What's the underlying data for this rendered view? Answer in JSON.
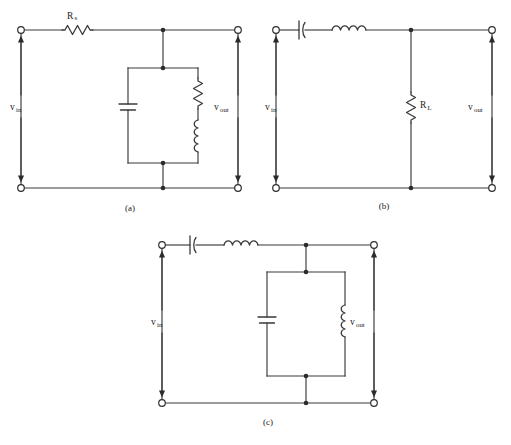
{
  "figure": {
    "background_color": "#ffffff",
    "ink_color": "#3a3a3a",
    "title": "",
    "type": "circuit-schematic-set"
  },
  "circuits": [
    {
      "id": "a",
      "caption": "(a)",
      "input_label_main": "v",
      "input_label_sub": "in",
      "output_label_main": "v",
      "output_label_sub": "out",
      "components": [
        {
          "name": "series-resistor",
          "symbol": "resistor",
          "label_main": "R",
          "label_sub": "s",
          "orientation": "horizontal",
          "position": "top-series"
        },
        {
          "name": "shunt-capacitor",
          "symbol": "capacitor",
          "label_main": "",
          "label_sub": "",
          "orientation": "vertical",
          "position": "shunt-left-branch"
        },
        {
          "name": "shunt-resistor",
          "symbol": "resistor",
          "label_main": "",
          "label_sub": "",
          "orientation": "vertical",
          "position": "shunt-right-branch-upper"
        },
        {
          "name": "shunt-inductor",
          "symbol": "inductor",
          "label_main": "",
          "label_sub": "",
          "orientation": "vertical",
          "position": "shunt-right-branch-lower"
        }
      ]
    },
    {
      "id": "b",
      "caption": "(b)",
      "input_label_main": "v",
      "input_label_sub": "in",
      "output_label_main": "v",
      "output_label_sub": "out",
      "components": [
        {
          "name": "series-capacitor",
          "symbol": "capacitor",
          "label_main": "",
          "label_sub": "",
          "orientation": "horizontal",
          "position": "top-series-left"
        },
        {
          "name": "series-inductor",
          "symbol": "inductor",
          "label_main": "",
          "label_sub": "",
          "orientation": "horizontal",
          "position": "top-series-right"
        },
        {
          "name": "load-resistor",
          "symbol": "resistor",
          "label_main": "R",
          "label_sub": "L",
          "orientation": "vertical",
          "position": "shunt-middle"
        }
      ]
    },
    {
      "id": "c",
      "caption": "(c)",
      "input_label_main": "v",
      "input_label_sub": "in",
      "output_label_main": "v",
      "output_label_sub": "out",
      "components": [
        {
          "name": "series-capacitor",
          "symbol": "capacitor",
          "label_main": "",
          "label_sub": "",
          "orientation": "horizontal",
          "position": "top-series-left"
        },
        {
          "name": "series-inductor",
          "symbol": "inductor",
          "label_main": "",
          "label_sub": "",
          "orientation": "horizontal",
          "position": "top-series-right"
        },
        {
          "name": "tank-capacitor",
          "symbol": "capacitor",
          "label_main": "",
          "label_sub": "",
          "orientation": "vertical",
          "position": "shunt-left-branch"
        },
        {
          "name": "tank-inductor",
          "symbol": "inductor",
          "label_main": "",
          "label_sub": "",
          "orientation": "vertical",
          "position": "shunt-right-branch"
        }
      ]
    }
  ]
}
